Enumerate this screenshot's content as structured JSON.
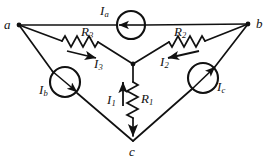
{
  "figure": {
    "type": "electrical-circuit-diagram",
    "stroke_color": "#111111",
    "background_color": "#ffffff"
  },
  "nodes": [
    {
      "id": "a",
      "label": "a",
      "x": 19,
      "y": 25
    },
    {
      "id": "b",
      "label": "b",
      "x": 248,
      "y": 24
    },
    {
      "id": "c",
      "label": "c",
      "x": 133,
      "y": 141
    },
    {
      "id": "center",
      "label": "",
      "x": 133,
      "y": 64
    }
  ],
  "node_labels": {
    "a": {
      "text": "a",
      "x": 4,
      "y": 18
    },
    "b": {
      "text": "b",
      "x": 256,
      "y": 17
    },
    "c": {
      "text": "c",
      "x": 129,
      "y": 145
    }
  },
  "resistors": [
    {
      "id": "R1",
      "base": "R",
      "sub": "1",
      "label": "R1",
      "label_x": 141,
      "label_y": 92,
      "orientation": "vertical"
    },
    {
      "id": "R2",
      "base": "R",
      "sub": "2",
      "label": "R2",
      "label_x": 174,
      "label_y": 25,
      "orientation": "diagonal"
    },
    {
      "id": "R3",
      "base": "R",
      "sub": "3",
      "label": "R3",
      "label_x": 81,
      "label_y": 25,
      "orientation": "diagonal"
    }
  ],
  "branch_currents": [
    {
      "id": "I1",
      "base": "I",
      "sub": "1",
      "label": "I1",
      "label_x": 107,
      "label_y": 93,
      "direction": "up"
    },
    {
      "id": "I2",
      "base": "I",
      "sub": "2",
      "label": "I2",
      "label_x": 160,
      "label_y": 55,
      "direction": "toward-center"
    },
    {
      "id": "I3",
      "base": "I",
      "sub": "3",
      "label": "I3",
      "label_x": 94,
      "label_y": 57,
      "direction": "toward-center"
    }
  ],
  "sources": [
    {
      "id": "Ia",
      "base": "I",
      "sub": "a",
      "label": "Ia",
      "cx": 131,
      "cy": 25,
      "r": 14,
      "label_x": 100,
      "label_y": 4,
      "arrow": "left",
      "branch": "a-b"
    },
    {
      "id": "Ib",
      "base": "I",
      "sub": "b",
      "label": "Ib",
      "cx": 65,
      "cy": 82,
      "r": 15,
      "label_x": 39,
      "label_y": 83,
      "arrow": "down-right",
      "branch": "a-c"
    },
    {
      "id": "Ic",
      "base": "I",
      "sub": "c",
      "label": "Ic",
      "cx": 203,
      "cy": 78,
      "r": 15,
      "label_x": 217,
      "label_y": 80,
      "arrow": "up-right",
      "branch": "c-b"
    }
  ]
}
